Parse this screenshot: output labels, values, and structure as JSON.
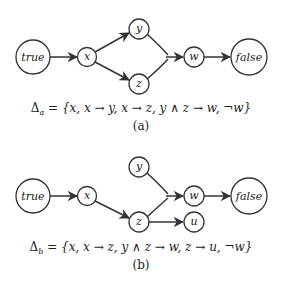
{
  "panels": [
    {
      "id": "a",
      "caption": "(a)",
      "formula": "Δa = {x, x → y, x → z, y ∧ z → w, ¬w}",
      "formula_parts": {
        "delta": "Δ",
        "subscript": "a",
        "body": " = {x, x → y, x → z, y ∧ z → w, ¬w}"
      },
      "nodes": [
        {
          "id": "true",
          "label": "true"
        },
        {
          "id": "x",
          "label": "x"
        },
        {
          "id": "y",
          "label": "y"
        },
        {
          "id": "z",
          "label": "z"
        },
        {
          "id": "w",
          "label": "w"
        },
        {
          "id": "false",
          "label": "false"
        }
      ],
      "edges": [
        [
          "true",
          "x"
        ],
        [
          "x",
          "y"
        ],
        [
          "x",
          "z"
        ],
        [
          "y",
          "w"
        ],
        [
          "z",
          "w"
        ],
        [
          "w",
          "false"
        ]
      ]
    },
    {
      "id": "b",
      "caption": "(b)",
      "formula": "Δb = {x, x → z, y ∧ z → w, z → u, ¬w}",
      "formula_parts": {
        "delta": "Δ",
        "subscript": "b",
        "body": " = {x, x → z, y ∧ z → w, z → u, ¬w}"
      },
      "nodes": [
        {
          "id": "true",
          "label": "true"
        },
        {
          "id": "x",
          "label": "x"
        },
        {
          "id": "y",
          "label": "y"
        },
        {
          "id": "z",
          "label": "z"
        },
        {
          "id": "w",
          "label": "w"
        },
        {
          "id": "u",
          "label": "u"
        },
        {
          "id": "false",
          "label": "false"
        }
      ],
      "edges": [
        [
          "true",
          "x"
        ],
        [
          "x",
          "z"
        ],
        [
          "y",
          "w"
        ],
        [
          "z",
          "w"
        ],
        [
          "z",
          "u"
        ],
        [
          "w",
          "false"
        ]
      ]
    }
  ]
}
